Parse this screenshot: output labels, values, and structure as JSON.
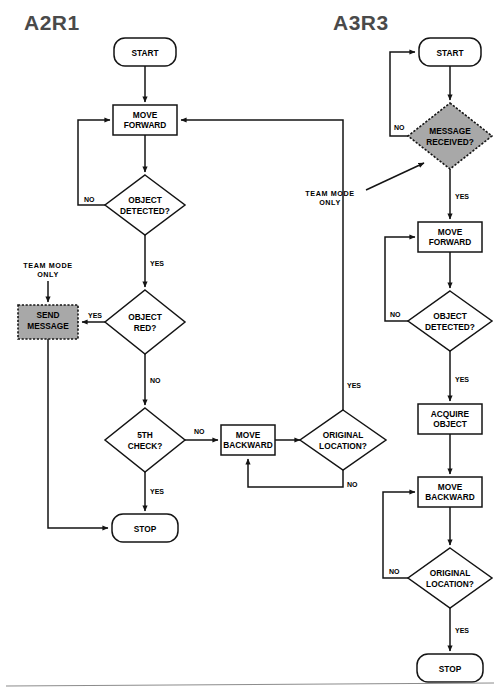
{
  "page": {
    "background": "#ffffff",
    "line_color": "#141414",
    "highlight_fill": "#a8a8a8",
    "title_color": "#4a4a4a",
    "footer_rule": true
  },
  "charts": [
    {
      "id": "a2r1",
      "title": "A2R1",
      "nodes": [
        {
          "id": "l-start",
          "type": "terminator",
          "label": "START",
          "line1": "START",
          "line2": ""
        },
        {
          "id": "l-fwd",
          "type": "process",
          "label": "MOVE FORWARD",
          "line1": "MOVE",
          "line2": "FORWARD"
        },
        {
          "id": "l-det",
          "type": "decision",
          "label": "OBJECT DETECTED?",
          "line1": "OBJECT",
          "line2": "DETECTED?"
        },
        {
          "id": "l-red",
          "type": "decision",
          "label": "OBJECT RED?",
          "line1": "OBJECT",
          "line2": "RED?"
        },
        {
          "id": "l-send",
          "type": "process-highlight",
          "label": "SEND MESSAGE",
          "line1": "SEND",
          "line2": "MESSAGE"
        },
        {
          "id": "l-5th",
          "type": "decision",
          "label": "5TH CHECK?",
          "line1": "5TH",
          "line2": "CHECK?"
        },
        {
          "id": "l-bwd",
          "type": "process",
          "label": "MOVE BACKWARD",
          "line1": "MOVE",
          "line2": "BACKWARD"
        },
        {
          "id": "l-orig",
          "type": "decision",
          "label": "ORIGINAL LOCATION?",
          "line1": "ORIGINAL",
          "line2": "LOCATION?"
        },
        {
          "id": "l-stop",
          "type": "terminator",
          "label": "STOP",
          "line1": "STOP",
          "line2": ""
        }
      ],
      "annotations": [
        {
          "id": "l-team-note",
          "line1": "TEAM  MODE",
          "line2": "ONLY"
        }
      ],
      "edges": [
        {
          "from": "l-start",
          "to": "l-fwd",
          "label": ""
        },
        {
          "from": "l-fwd",
          "to": "l-det",
          "label": ""
        },
        {
          "from": "l-det",
          "to": "l-fwd",
          "label": "NO"
        },
        {
          "from": "l-det",
          "to": "l-red",
          "label": "YES"
        },
        {
          "from": "l-red",
          "to": "l-send",
          "label": "YES"
        },
        {
          "from": "l-red",
          "to": "l-5th",
          "label": "NO"
        },
        {
          "from": "l-5th",
          "to": "l-bwd",
          "label": "NO"
        },
        {
          "from": "l-5th",
          "to": "l-stop",
          "label": "YES"
        },
        {
          "from": "l-bwd",
          "to": "l-orig",
          "label": ""
        },
        {
          "from": "l-orig",
          "to": "l-fwd",
          "label": "YES"
        },
        {
          "from": "l-orig",
          "to": "l-bwd",
          "label": "NO"
        },
        {
          "from": "l-send",
          "to": "l-stop",
          "label": ""
        }
      ]
    },
    {
      "id": "a3r3",
      "title": "A3R3",
      "nodes": [
        {
          "id": "r-start",
          "type": "terminator",
          "label": "START",
          "line1": "START",
          "line2": ""
        },
        {
          "id": "r-msg",
          "type": "decision-highlight",
          "label": "MESSAGE RECEIVED?",
          "line1": "MESSAGE",
          "line2": "RECEIVED?"
        },
        {
          "id": "r-fwd",
          "type": "process",
          "label": "MOVE FORWARD",
          "line1": "MOVE",
          "line2": "FORWARD"
        },
        {
          "id": "r-det",
          "type": "decision",
          "label": "OBJECT DETECTED?",
          "line1": "OBJECT",
          "line2": "DETECTED?"
        },
        {
          "id": "r-acq",
          "type": "process",
          "label": "ACQUIRE OBJECT",
          "line1": "ACQUIRE",
          "line2": "OBJECT"
        },
        {
          "id": "r-bwd",
          "type": "process",
          "label": "MOVE BACKWARD",
          "line1": "MOVE",
          "line2": "BACKWARD"
        },
        {
          "id": "r-orig",
          "type": "decision",
          "label": "ORIGINAL LOCATION?",
          "line1": "ORIGINAL",
          "line2": "LOCATION?"
        },
        {
          "id": "r-stop",
          "type": "terminator",
          "label": "STOP",
          "line1": "STOP",
          "line2": ""
        }
      ],
      "annotations": [
        {
          "id": "r-team-note",
          "line1": "TEAM MODE",
          "line2": "ONLY"
        }
      ],
      "edges": [
        {
          "from": "r-start",
          "to": "r-msg",
          "label": ""
        },
        {
          "from": "r-msg",
          "to": "r-start",
          "label": "NO"
        },
        {
          "from": "r-msg",
          "to": "r-fwd",
          "label": "YES"
        },
        {
          "from": "r-fwd",
          "to": "r-det",
          "label": ""
        },
        {
          "from": "r-det",
          "to": "r-fwd",
          "label": "NO"
        },
        {
          "from": "r-det",
          "to": "r-acq",
          "label": "YES"
        },
        {
          "from": "r-acq",
          "to": "r-bwd",
          "label": ""
        },
        {
          "from": "r-bwd",
          "to": "r-orig",
          "label": ""
        },
        {
          "from": "r-orig",
          "to": "r-bwd",
          "label": "NO"
        },
        {
          "from": "r-orig",
          "to": "r-stop",
          "label": "YES"
        }
      ]
    }
  ],
  "labels": {
    "yes": "YES",
    "no": "NO",
    "no_spaced": "NO"
  }
}
